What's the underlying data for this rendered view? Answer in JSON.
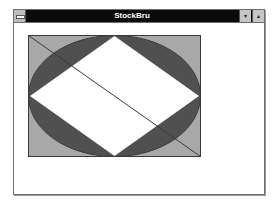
{
  "window": {
    "title": "StockBru",
    "sysmenu_icon": "system-menu-icon",
    "minimize_icon": "▾",
    "maximize_icon": "▴"
  },
  "drawing": {
    "colors": {
      "background_rect": "#a8a8a8",
      "ellipse": "#505050",
      "diamond": "#ffffff",
      "line": "#3a3a3a",
      "outline": "#3a3a3a"
    },
    "shapes": [
      "gray-rectangle",
      "dark-ellipse",
      "white-diamond",
      "diagonal-line"
    ]
  }
}
